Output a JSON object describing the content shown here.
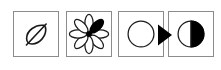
{
  "figure": {
    "title": "",
    "background_color": "#ffffff",
    "panel_border_color": "#8c8c8c",
    "ink_color": "#000000",
    "panel_count": 4
  },
  "panels": [
    {
      "id": "leaf",
      "icon_name": "leaf-icon",
      "label": "",
      "description": "Outlined leaf with central midrib vein",
      "fill": "none",
      "stroke": "#1a1a1a"
    },
    {
      "id": "flower",
      "icon_name": "flower-icon",
      "label": "",
      "description": "Eight-petal flower outline with upper-right petal filled solid black",
      "petal_count": 8,
      "filled_petal_index": 1,
      "fill": "#000000",
      "stroke": "#1a1a1a"
    },
    {
      "id": "circle",
      "icon_name": "empty-circle-icon",
      "label": "",
      "description": "Hollow outlined circle",
      "fill": "none",
      "stroke": "#1a1a1a"
    },
    {
      "id": "half-circle",
      "icon_name": "half-filled-circle-icon",
      "label": "",
      "description": "Circle with the right half filled solid black",
      "fill": "#000000",
      "stroke": "#1a1a1a"
    }
  ],
  "connectors": [
    {
      "id": "arrow-3-to-4",
      "icon_name": "right-arrow-icon",
      "label": "",
      "from": "circle",
      "to": "half-circle",
      "direction": "right",
      "color": "#000000"
    }
  ]
}
